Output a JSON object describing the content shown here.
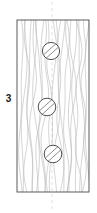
{
  "figure": {
    "label": "3",
    "label_position": {
      "x": 6,
      "y": 98
    },
    "type": "technical-line-drawing",
    "canvas": {
      "width": 97,
      "height": 213,
      "background": "#ffffff"
    },
    "colors": {
      "outline": "#4a4a4a",
      "grain": "#b9b9b9",
      "screw_outline": "#3c3c3c",
      "screw_fill": "#ffffff",
      "slot": "#6e6e6e",
      "centerline": "#cfcfcf",
      "label": "#1a1a1a"
    },
    "panel": {
      "name": "wood-panel",
      "x": 17,
      "y": 20,
      "width": 72,
      "height": 172,
      "stroke_width": 0.9
    },
    "centerline": {
      "name": "vertical-centerline",
      "x": 52,
      "y_top": 2,
      "y_bottom": 211,
      "dash": "3 3",
      "stroke_width": 0.6
    },
    "screws": [
      {
        "name": "screw-top",
        "cx": 51,
        "cy": 51,
        "r": 8.6,
        "slot_angle_deg": -42,
        "slot_half_width": 2.1
      },
      {
        "name": "screw-middle",
        "cx": 47,
        "cy": 107,
        "r": 8.8,
        "slot_angle_deg": -42,
        "slot_half_width": 2.2
      },
      {
        "name": "screw-bottom",
        "cx": 53,
        "cy": 154,
        "r": 8.8,
        "slot_angle_deg": -42,
        "slot_half_width": 2.2
      }
    ],
    "grain_lines": [
      {
        "x": 21,
        "a": 1.6,
        "b": 0.9,
        "p": 1.05
      },
      {
        "x": 24,
        "a": 2.2,
        "b": -1.2,
        "p": 0.85
      },
      {
        "x": 27,
        "a": -1.8,
        "b": 1.5,
        "p": 1.25
      },
      {
        "x": 30,
        "a": 2.6,
        "b": 1.0,
        "p": 0.95
      },
      {
        "x": 33,
        "a": -2.4,
        "b": -1.6,
        "p": 1.15
      },
      {
        "x": 36,
        "a": 1.9,
        "b": 2.0,
        "p": 0.75
      },
      {
        "x": 39,
        "a": 3.1,
        "b": -0.8,
        "p": 1.35
      },
      {
        "x": 42,
        "a": -2.0,
        "b": 1.8,
        "p": 0.9
      },
      {
        "x": 45,
        "a": 2.4,
        "b": -2.1,
        "p": 1.1
      },
      {
        "x": 49,
        "a": -1.5,
        "b": 1.3,
        "p": 1.45
      },
      {
        "x": 53,
        "a": 2.8,
        "b": 1.7,
        "p": 0.8
      },
      {
        "x": 57,
        "a": -2.6,
        "b": -1.1,
        "p": 1.2
      },
      {
        "x": 60,
        "a": 1.7,
        "b": 2.3,
        "p": 1.0
      },
      {
        "x": 63,
        "a": 2.9,
        "b": -1.5,
        "p": 0.7
      },
      {
        "x": 66,
        "a": -2.2,
        "b": 1.1,
        "p": 1.3
      },
      {
        "x": 69,
        "a": 1.4,
        "b": -2.0,
        "p": 0.95
      },
      {
        "x": 72,
        "a": 2.5,
        "b": 1.6,
        "p": 1.15
      },
      {
        "x": 75,
        "a": -1.9,
        "b": -1.4,
        "p": 0.85
      },
      {
        "x": 78,
        "a": 2.1,
        "b": 1.9,
        "p": 1.25
      },
      {
        "x": 81,
        "a": -2.7,
        "b": 0.8,
        "p": 1.0
      },
      {
        "x": 84,
        "a": 1.3,
        "b": -1.7,
        "p": 1.4
      },
      {
        "x": 87,
        "a": 1.8,
        "b": 1.2,
        "p": 0.9
      }
    ]
  }
}
